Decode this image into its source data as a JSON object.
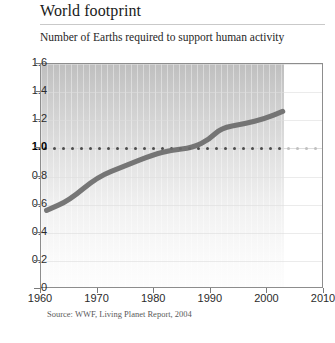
{
  "header": {
    "title": "World footprint",
    "subtitle": "Number of Earths required to support human activity"
  },
  "footer": {
    "source": "Source: WWF, Living Planet Report, 2004"
  },
  "colors": {
    "line": "#6b6b6b",
    "dotted_reference": "#4c4c4c",
    "dotted_reference_faded": "#c0c0c0",
    "frame": "#8d8d8d",
    "text": "#2b2b2b"
  },
  "chart_data": {
    "type": "line",
    "title": "World footprint",
    "subtitle": "Number of Earths required to support human activity",
    "xlabel": "",
    "ylabel": "",
    "xlim": [
      1960,
      2010
    ],
    "ylim": [
      0,
      1.6
    ],
    "xticks": [
      "1960",
      "1970",
      "1980",
      "1990",
      "2000",
      "2010"
    ],
    "xtick_values": [
      1960,
      1970,
      1980,
      1990,
      2000,
      2010
    ],
    "yticks": [
      "0",
      "0.2",
      "0.4",
      "0.6",
      "0.8",
      "1.0",
      "1.2",
      "1.4",
      "1.6"
    ],
    "ytick_values": [
      0,
      0.2,
      0.4,
      0.6,
      0.8,
      1.0,
      1.2,
      1.4,
      1.6
    ],
    "ytick_emphasis": "1.0",
    "grid": true,
    "legend": "none",
    "data_end_year": 2003,
    "series": [
      {
        "name": "Number of Earths required",
        "x": [
          1961,
          1965,
          1970,
          1975,
          1980,
          1983,
          1987,
          1990,
          1992,
          1996,
          2000,
          2003
        ],
        "values": [
          0.55,
          0.62,
          0.79,
          0.87,
          0.95,
          0.98,
          1.0,
          1.06,
          1.14,
          1.17,
          1.21,
          1.26
        ]
      },
      {
        "name": "One Earth reference",
        "style": "dotted",
        "x": [
          1960,
          2010
        ],
        "values": [
          1.0,
          1.0
        ]
      }
    ]
  }
}
